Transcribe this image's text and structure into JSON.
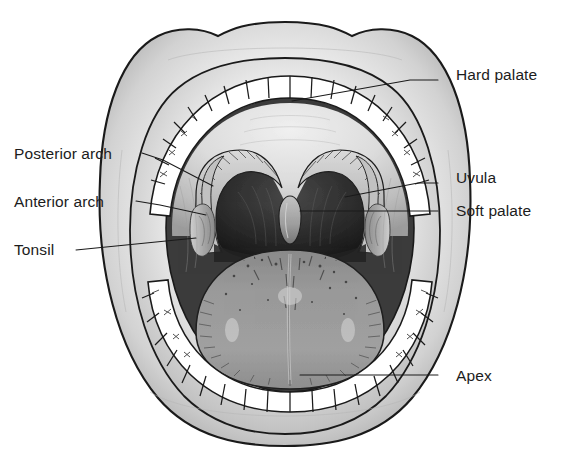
{
  "figure": {
    "name": "oral-cavity-anatomy-diagram",
    "background_color": "#ffffff",
    "line_color": "#1a1a1a",
    "label_color": "#1c1c1c"
  },
  "colors": {
    "background": "#ffffff",
    "outline": "#1a1a1a",
    "lip_light": "#fbfbfb",
    "lip_mid": "#d8d8d8",
    "lip_shadow": "#a8a8a8",
    "tooth_fill": "#ffffff",
    "palate_light": "#e8e8e8",
    "palate_mid": "#c9c9c9",
    "oral_dark": "#6f6f6f",
    "throat_dark": "#2a2a2a",
    "tongue": "#989898",
    "tongue_dark": "#7d7d7d",
    "tonsil": "#9a9a9a"
  },
  "labels": [
    {
      "id": "hard-palate",
      "text": "Hard palate",
      "side": "right",
      "text_x": 456,
      "text_y": 80,
      "leader": "M 438 80 L 410 80 L 292 101",
      "target": "roof of mouth"
    },
    {
      "id": "uvula",
      "text": "Uvula",
      "side": "right",
      "text_x": 456,
      "text_y": 183,
      "leader": "M 438 183 L 418 183 L 345 197",
      "target": "uvula tip"
    },
    {
      "id": "soft-palate",
      "text": "Soft palate",
      "side": "right",
      "text_x": 456,
      "text_y": 216,
      "leader": "M 438 211 L 300 211",
      "target": "soft palate"
    },
    {
      "id": "apex",
      "text": "Apex",
      "side": "right",
      "text_x": 456,
      "text_y": 381,
      "leader": "M 438 375 L 300 375",
      "target": "tongue tip"
    },
    {
      "id": "posterior-arch",
      "text": "Posterior arch",
      "side": "left",
      "text_x": 14,
      "text_y": 159,
      "leader": "M 142 153 L 163 160 L 213 186",
      "target": "palatopharyngeal arch"
    },
    {
      "id": "anterior-arch",
      "text": "Anterior arch",
      "side": "left",
      "text_x": 14,
      "text_y": 207,
      "leader": "M 136 201 L 160 205 L 206 215",
      "target": "palatoglossal arch"
    },
    {
      "id": "tonsil",
      "text": "Tonsil",
      "side": "left",
      "text_x": 14,
      "text_y": 255,
      "leader": "M 76 250 L 196 238",
      "target": "palatine tonsil"
    }
  ],
  "structures": [
    {
      "id": "upper-lip",
      "name": "upper lip"
    },
    {
      "id": "lower-lip",
      "name": "lower lip"
    },
    {
      "id": "upper-teeth",
      "name": "upper teeth arch",
      "count": 16
    },
    {
      "id": "lower-teeth",
      "name": "lower teeth arch",
      "count": 16
    },
    {
      "id": "hard-palate-surface",
      "name": "hard palate"
    },
    {
      "id": "soft-palate-surface",
      "name": "soft palate"
    },
    {
      "id": "uvula-shape",
      "name": "uvula"
    },
    {
      "id": "anterior-arch-left",
      "name": "anterior arch left"
    },
    {
      "id": "anterior-arch-right",
      "name": "anterior arch right"
    },
    {
      "id": "posterior-arch-left",
      "name": "posterior arch left"
    },
    {
      "id": "posterior-arch-right",
      "name": "posterior arch right"
    },
    {
      "id": "tonsil-left",
      "name": "left palatine tonsil"
    },
    {
      "id": "tonsil-right",
      "name": "right palatine tonsil"
    },
    {
      "id": "oropharynx",
      "name": "oropharynx opening"
    },
    {
      "id": "tongue-body",
      "name": "tongue dorsum"
    },
    {
      "id": "tongue-sulcus",
      "name": "median sulcus"
    }
  ]
}
